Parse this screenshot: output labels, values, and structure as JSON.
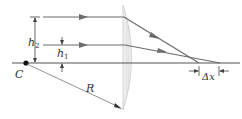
{
  "labels": {
    "h2": "h",
    "h2_sub": "2",
    "h1": "h",
    "h1_sub": "1",
    "center": "C",
    "radius": "R",
    "delta_x": "Δx"
  },
  "colors": {
    "ray": "#6b6b6b",
    "axis": "#555555",
    "lens_edge": "#c8c8c8",
    "lens_fill": "#ececec",
    "text": "#333333"
  }
}
